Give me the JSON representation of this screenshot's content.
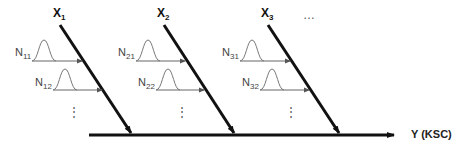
{
  "diagram": {
    "type": "fishbone",
    "output_label": "Y (KSC)",
    "causes": [
      {
        "label": "X",
        "sub": "1",
        "noises": [
          {
            "label": "N",
            "sub": "11"
          },
          {
            "label": "N",
            "sub": "12"
          }
        ]
      },
      {
        "label": "X",
        "sub": "2",
        "noises": [
          {
            "label": "N",
            "sub": "21"
          },
          {
            "label": "N",
            "sub": "22"
          }
        ]
      },
      {
        "label": "X",
        "sub": "3",
        "noises": [
          {
            "label": "N",
            "sub": "31"
          },
          {
            "label": "N",
            "sub": "32"
          }
        ]
      }
    ],
    "more_causes": "…",
    "more_noises": "⋮"
  }
}
